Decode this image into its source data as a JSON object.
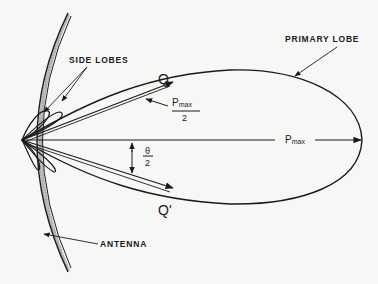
{
  "diagram": {
    "type": "antenna-radiation-pattern",
    "labels": {
      "side_lobes": "SIDE LOBES",
      "primary_lobe": "PRIMARY LOBE",
      "antenna": "ANTENNA",
      "q": "Q",
      "q_prime": "Q'",
      "pmax": "P",
      "pmax_sub": "max",
      "half_pmax_num": "P",
      "half_pmax_sub": "max",
      "half_pmax_den": "2",
      "theta_num": "θ",
      "theta_den": "2"
    },
    "colors": {
      "ink": "#1a1a1a",
      "paper": "#f7f7f5"
    }
  }
}
